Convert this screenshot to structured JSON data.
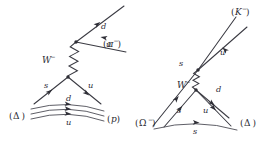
{
  "figure": {
    "type": "feynman-diagram-pair",
    "background_color": "#ffffff",
    "line_color": "#3a3a42",
    "text_color": "#2a2a32"
  },
  "left_diagram": {
    "name": "delta-to-proton-pion-decay",
    "initial_hadron": {
      "symbol": "Δ",
      "open_paren": "(",
      "close_paren": ")",
      "label": "(Δ)"
    },
    "final_baryon": {
      "symbol": "p",
      "open_paren": "(",
      "close_paren": ")",
      "label": "(p)"
    },
    "final_meson": {
      "symbol": "π",
      "charge": "−",
      "label": "(π⁻)"
    },
    "boson": {
      "symbol": "W",
      "charge": "−",
      "label": "W⁻"
    },
    "quark_labels": {
      "emitted_d": "d",
      "emitted_u": "u",
      "decaying_s": "s",
      "spectator_u": "u",
      "spectator_d": "d",
      "spectator_u_bottom": "u"
    }
  },
  "right_diagram": {
    "name": "omega-to-delta-kaon-decay",
    "initial_hadron": {
      "symbol": "Ω",
      "charge": "−",
      "label": "(Ω⁻)"
    },
    "final_baryon": {
      "symbol": "Δ",
      "open_paren": "(",
      "close_paren": ")",
      "label": "(Δ)"
    },
    "final_meson": {
      "symbol": "K",
      "charge": "−",
      "label": "(K⁻)"
    },
    "boson": {
      "symbol": "W",
      "charge": "−",
      "label": "W⁻"
    },
    "quark_labels": {
      "emitted_s": "s",
      "emitted_u": "u",
      "emitted_d": "d",
      "spectator_s": "s",
      "spectator_u": "u",
      "bottom_s": "s"
    }
  }
}
